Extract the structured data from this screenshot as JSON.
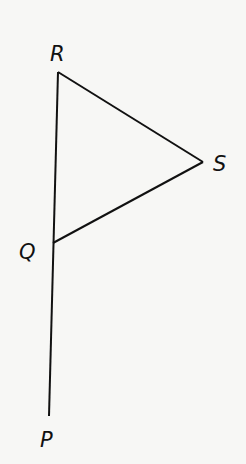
{
  "diagram": {
    "type": "geometry",
    "stroke_color": "#111111",
    "background_color": "#f7f7f5",
    "points": {
      "R": {
        "label": "R",
        "x": 58,
        "y": 72
      },
      "S": {
        "label": "S",
        "x": 203,
        "y": 162
      },
      "Q": {
        "label": "Q",
        "x": 53,
        "y": 243
      },
      "P": {
        "label": "P",
        "x": 49,
        "y": 416
      }
    },
    "segments": [
      "RS",
      "SQ",
      "RQ",
      "QP"
    ]
  }
}
